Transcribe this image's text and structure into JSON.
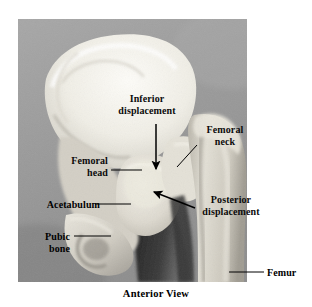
{
  "figure": {
    "caption": "Anterior View",
    "view": "Anterior View",
    "top_clipped_text": "",
    "photo": {
      "left": 18,
      "top": 19,
      "width": 229,
      "height": 263,
      "background_color": "#9a9a9a",
      "bone_color": "#e9e7e0",
      "shadow_color": "#2a2a2a"
    }
  },
  "labels": {
    "inferior_displacement": "Inferior\ndisplacement",
    "femoral_neck": "Femoral\nneck",
    "femoral_head": "Femoral\nhead",
    "acetabulum": "Acetabulum",
    "posterior_displacement": "Posterior\ndisplacement",
    "pubic_bone": "Pubic\nbone",
    "femur": "Femur"
  },
  "annotations": {
    "arrows": [
      {
        "name": "inferior-displacement-arrow",
        "label": "Inferior displacement",
        "direction": "down",
        "from": [
          156,
          124
        ],
        "to": [
          156,
          172
        ]
      },
      {
        "name": "posterior-displacement-arrow",
        "label": "Posterior displacement",
        "direction": "up-left",
        "from": [
          194,
          207
        ],
        "to": [
          151,
          191
        ]
      }
    ],
    "leader_lines": [
      {
        "name": "femoral-neck-leader",
        "label": "Femoral neck",
        "from": [
          196,
          144
        ],
        "to": [
          178,
          166
        ]
      },
      {
        "name": "femoral-head-leader",
        "label": "Femoral head",
        "from": [
          111,
          171
        ],
        "to": [
          142,
          171
        ]
      },
      {
        "name": "acetabulum-leader",
        "label": "Acetabulum",
        "from": [
          94,
          205
        ],
        "to": [
          130,
          205
        ]
      },
      {
        "name": "pubic-bone-leader",
        "label": "Pubic bone",
        "from": [
          74,
          237
        ],
        "to": [
          111,
          237
        ]
      },
      {
        "name": "femur-leader",
        "label": "Femur",
        "from": [
          229,
          273
        ],
        "to": [
          264,
          273
        ]
      }
    ]
  },
  "colors": {
    "text": "#000000",
    "line": "#000000",
    "page_background": "#ffffff",
    "photo_background": "#9a9a9a"
  }
}
